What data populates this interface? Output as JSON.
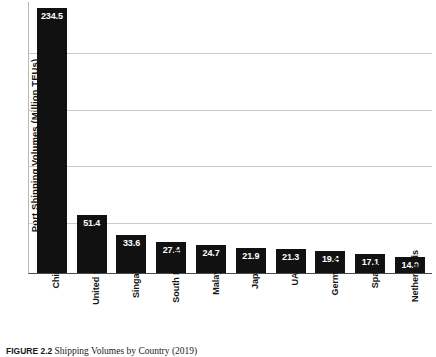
{
  "chart_data": {
    "type": "bar",
    "title": "",
    "xlabel": "",
    "ylabel": "Port Shipping Volumes (Million TEUs)",
    "ylim": [
      0,
      241
    ],
    "grid": true,
    "gridlines": [
      50,
      100,
      150,
      200
    ],
    "legend": "none",
    "y_tick_labels": [],
    "categories": [
      "China",
      "United States",
      "Singapore",
      "South Korea",
      "Malaysia",
      "Japan",
      "UAE",
      "Germany",
      "Spain",
      "Netherlands"
    ],
    "values": [
      234.5,
      51.4,
      33.6,
      27.4,
      24.7,
      21.9,
      21.3,
      19.4,
      17.1,
      14.0
    ],
    "value_labels": [
      "234.5",
      "51.4",
      "33.6",
      "27.4",
      "24.7",
      "21.9",
      "21.3",
      "19.4",
      "17.1",
      "14.0"
    ],
    "bar_color": "#111111",
    "value_label_color": "#ffffff",
    "gridline_color": "#c9c9c9",
    "axis_color": "#4a4a4a"
  },
  "caption": {
    "label": "FIGURE 2.2",
    "text": "Shipping Volumes by Country (2019)"
  }
}
